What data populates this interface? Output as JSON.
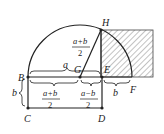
{
  "diagram": {
    "points": {
      "H": "H",
      "B": "B",
      "G": "G",
      "E": "E",
      "F": "F",
      "C": "C",
      "D": "D"
    },
    "labels": {
      "a": "a",
      "b_left": "b",
      "b_right": "b",
      "HG_num": "a+b",
      "HG_den": "2",
      "BG_num": "a+b",
      "BG_den": "2",
      "GE_num": "a−b",
      "GE_den": "2"
    },
    "colors": {
      "stroke": "#222222",
      "hatch": "#555555",
      "background": "#ffffff"
    }
  }
}
